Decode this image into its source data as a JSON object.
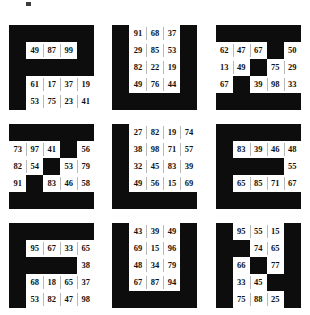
{
  "figure": {
    "title": "",
    "corner_mark": "▪",
    "panel_count": 9,
    "grid_rows": 3,
    "grid_cols": 3,
    "cell_rows": 5,
    "cell_cols": 5,
    "background_color": "#0d0d0d",
    "cell_color": "#ffffff",
    "text_color": "#111111",
    "panels": [
      {
        "id": "panel-1",
        "rows": [
          [
            "",
            "",
            "",
            "",
            ""
          ],
          [
            "",
            "49",
            "87",
            "99",
            ""
          ],
          [
            "",
            "",
            "",
            "",
            ""
          ],
          [
            "",
            "61",
            "17",
            "37",
            "19"
          ],
          [
            "",
            "53",
            "75",
            "23",
            "41"
          ]
        ]
      },
      {
        "id": "panel-2",
        "rows": [
          [
            "",
            "91",
            "68",
            "37",
            ""
          ],
          [
            "",
            "29",
            "85",
            "53",
            ""
          ],
          [
            "",
            "82",
            "22",
            "19",
            ""
          ],
          [
            "",
            "49",
            "76",
            "44",
            ""
          ],
          [
            "",
            "",
            "",
            "",
            ""
          ]
        ]
      },
      {
        "id": "panel-3",
        "rows": [
          [
            "",
            "",
            "",
            "",
            ""
          ],
          [
            "62",
            "47",
            "67",
            "",
            "50"
          ],
          [
            "13",
            "49",
            "",
            "75",
            "29"
          ],
          [
            "67",
            "",
            "39",
            "98",
            "33"
          ],
          [
            "",
            "",
            "",
            "",
            ""
          ]
        ]
      },
      {
        "id": "panel-4",
        "rows": [
          [
            "",
            "",
            "",
            "",
            ""
          ],
          [
            "73",
            "97",
            "41",
            "",
            "56"
          ],
          [
            "82",
            "54",
            "",
            "53",
            "79"
          ],
          [
            "91",
            "",
            "83",
            "46",
            "58"
          ],
          [
            "",
            "",
            "",
            "",
            ""
          ]
        ]
      },
      {
        "id": "panel-5",
        "rows": [
          [
            "",
            "27",
            "82",
            "19",
            "74"
          ],
          [
            "",
            "38",
            "98",
            "71",
            "57"
          ],
          [
            "",
            "32",
            "45",
            "83",
            "39"
          ],
          [
            "",
            "49",
            "56",
            "15",
            "69"
          ],
          [
            "",
            "",
            "",
            "",
            ""
          ]
        ]
      },
      {
        "id": "panel-6",
        "rows": [
          [
            "",
            "",
            "",
            "",
            ""
          ],
          [
            "",
            "83",
            "39",
            "46",
            "48"
          ],
          [
            "",
            "",
            "",
            "",
            "55"
          ],
          [
            "",
            "65",
            "85",
            "71",
            "67"
          ],
          [
            "",
            "",
            "",
            "",
            ""
          ]
        ]
      },
      {
        "id": "panel-7",
        "rows": [
          [
            "",
            "",
            "",
            "",
            ""
          ],
          [
            "",
            "95",
            "67",
            "33",
            "65"
          ],
          [
            "",
            "",
            "",
            "",
            "38"
          ],
          [
            "",
            "68",
            "18",
            "65",
            "37"
          ],
          [
            "",
            "53",
            "82",
            "47",
            "98"
          ]
        ]
      },
      {
        "id": "panel-8",
        "rows": [
          [
            "",
            "43",
            "39",
            "49",
            ""
          ],
          [
            "",
            "69",
            "15",
            "96",
            ""
          ],
          [
            "",
            "48",
            "34",
            "79",
            ""
          ],
          [
            "",
            "67",
            "87",
            "94",
            ""
          ],
          [
            "",
            "",
            "",
            "",
            ""
          ]
        ]
      },
      {
        "id": "panel-9",
        "rows": [
          [
            "",
            "95",
            "55",
            "15",
            ""
          ],
          [
            "",
            "",
            "74",
            "65",
            ""
          ],
          [
            "",
            "66",
            "",
            "77",
            ""
          ],
          [
            "",
            "33",
            "45",
            "",
            ""
          ],
          [
            "",
            "75",
            "88",
            "25",
            ""
          ]
        ]
      }
    ]
  }
}
